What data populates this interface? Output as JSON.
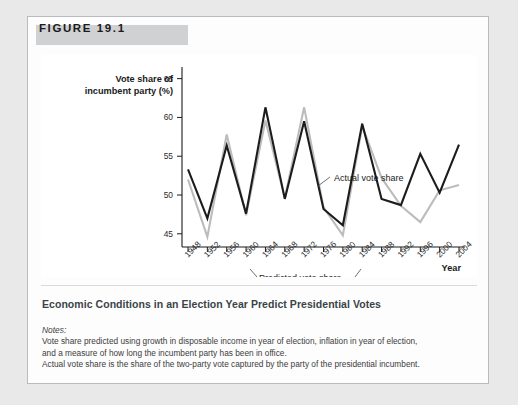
{
  "figure": {
    "header_label": "FIGURE 19.1",
    "caption": "Economic Conditions in an Election Year Predict Presidential Votes"
  },
  "notes": {
    "heading": "Notes:",
    "lines": [
      "Vote share predicted using growth in disposable income in year of election, inflation in year of election,",
      "and a measure of how long the incumbent party has been in office.",
      "Actual vote share is the share of the two-party vote captured by the party of the presidential incumbent."
    ]
  },
  "chart_data": {
    "type": "line",
    "title": "",
    "xlabel": "Year",
    "ylabel": "Vote share of incumbent party (%)",
    "ylabel_lines": [
      "Vote share of",
      "incumbent party (%)"
    ],
    "categories": [
      1948,
      1952,
      1956,
      1960,
      1964,
      1968,
      1972,
      1976,
      1980,
      1984,
      1988,
      1992,
      1996,
      2000,
      2004
    ],
    "tick_labels": [
      "1948",
      "1952",
      "1956",
      "1960",
      "1964",
      "1968",
      "1972",
      "1976",
      "1980",
      "1984",
      "1988",
      "1992",
      "1996",
      "2000",
      "2004"
    ],
    "yticks": [
      45,
      50,
      55,
      60,
      65
    ],
    "ylim": [
      43.3,
      66.5
    ],
    "grid": false,
    "legend_position": "annotations",
    "series": [
      {
        "name": "Actual vote share",
        "color": "#1c1c1c",
        "values": [
          53.3,
          47.0,
          56.4,
          47.6,
          61.3,
          49.5,
          59.5,
          48.2,
          46.1,
          59.2,
          49.5,
          48.7,
          55.3,
          50.3,
          56.5
        ]
      },
      {
        "name": "Predicted vote share",
        "color": "#bcbcbc",
        "values": [
          52.0,
          44.6,
          57.8,
          47.4,
          59.6,
          49.6,
          61.3,
          48.4,
          44.8,
          58.9,
          52.2,
          48.6,
          46.5,
          50.6,
          51.3
        ]
      }
    ],
    "annotations": [
      {
        "name": "actual-vote-share",
        "text": "Actual vote share",
        "x": 295,
        "y": 125
      },
      {
        "name": "predicted-vote-share",
        "text": "Predicted vote share",
        "x": 218,
        "y": 228
      }
    ]
  }
}
